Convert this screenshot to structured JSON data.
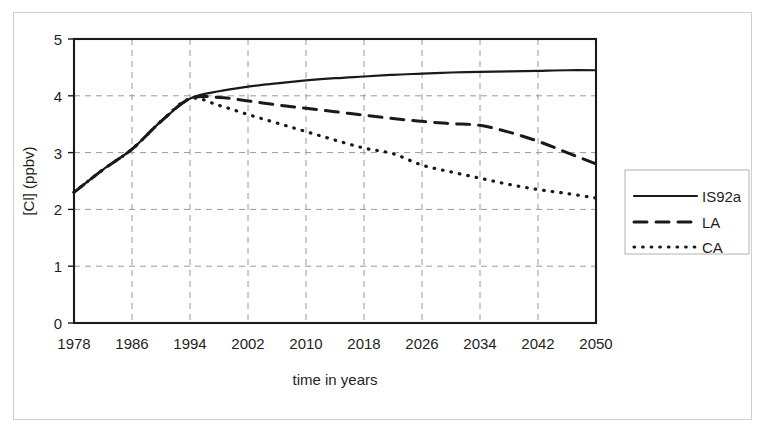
{
  "chart_data": {
    "type": "line",
    "title": "",
    "xlabel": "time in years",
    "ylabel": "[Cl] (ppbv)",
    "xlim": [
      1978,
      2050
    ],
    "ylim": [
      0,
      5
    ],
    "xticks": [
      1978,
      1986,
      1994,
      2002,
      2010,
      2018,
      2026,
      2034,
      2042,
      2050
    ],
    "yticks": [
      0,
      1,
      2,
      3,
      4,
      5
    ],
    "grid": true,
    "legend_position": "right-outside",
    "x": [
      1978,
      1982,
      1986,
      1990,
      1994,
      1998,
      2002,
      2006,
      2010,
      2014,
      2018,
      2022,
      2026,
      2030,
      2034,
      2038,
      2042,
      2046,
      2050
    ],
    "series": [
      {
        "name": "IS92a",
        "style": "solid",
        "values": [
          2.3,
          2.7,
          3.06,
          3.55,
          3.95,
          4.08,
          4.16,
          4.22,
          4.27,
          4.31,
          4.34,
          4.37,
          4.39,
          4.41,
          4.42,
          4.43,
          4.44,
          4.45,
          4.45
        ]
      },
      {
        "name": "LA",
        "style": "dashed",
        "values": [
          2.3,
          2.7,
          3.06,
          3.55,
          3.95,
          3.97,
          3.91,
          3.84,
          3.78,
          3.72,
          3.66,
          3.6,
          3.55,
          3.51,
          3.48,
          3.36,
          3.2,
          3.0,
          2.8
        ]
      },
      {
        "name": "CA",
        "style": "dotted",
        "values": [
          2.3,
          2.7,
          3.06,
          3.55,
          3.95,
          3.83,
          3.67,
          3.52,
          3.37,
          3.22,
          3.08,
          2.98,
          2.78,
          2.66,
          2.55,
          2.44,
          2.35,
          2.28,
          2.2
        ]
      }
    ]
  },
  "legend": {
    "entries": [
      {
        "label": "IS92a",
        "style": "solid"
      },
      {
        "label": "LA",
        "style": "dashed"
      },
      {
        "label": "CA",
        "style": "dotted"
      }
    ]
  },
  "axes": {
    "x_tick_labels": [
      "1978",
      "1986",
      "1994",
      "2002",
      "2010",
      "2018",
      "2026",
      "2034",
      "2042",
      "2050"
    ],
    "y_tick_labels": [
      "5",
      "4",
      "3",
      "2",
      "1",
      "0"
    ],
    "x_axis_title": "time in years",
    "y_axis_title": "[Cl] (ppbv)"
  },
  "colors": {
    "line": "#1a1a1a",
    "grid": "#9a9a9a",
    "frame": "#1a1a1a",
    "background": "#ffffff",
    "outer_border": "#cfcfcf"
  }
}
